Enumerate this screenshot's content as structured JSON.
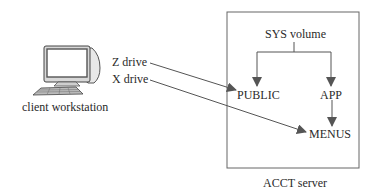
{
  "client": {
    "label": "client workstation",
    "icon": "computer-workstation-icon"
  },
  "drives": [
    {
      "label": "Z drive",
      "maps_to": "PUBLIC"
    },
    {
      "label": "X drive",
      "maps_to": "MENUS"
    }
  ],
  "server": {
    "label": "ACCT server",
    "volume": "SYS volume",
    "folders": {
      "public": "PUBLIC",
      "app": "APP",
      "menus": "MENUS"
    }
  },
  "colors": {
    "line": "#555555",
    "text": "#2a2a2a",
    "box": "#666666"
  }
}
